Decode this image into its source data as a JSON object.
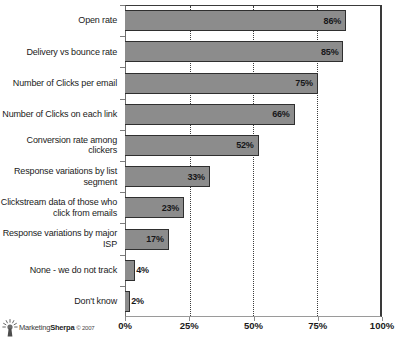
{
  "chart_data": {
    "type": "bar",
    "orientation": "horizontal",
    "title": "",
    "xlabel": "",
    "ylabel": "",
    "xlim": [
      0,
      100
    ],
    "xticks": [
      "0%",
      "25%",
      "50%",
      "75%",
      "100%"
    ],
    "xtick_values": [
      0,
      25,
      50,
      75,
      100
    ],
    "grid": "vertical-dotted",
    "legend": "none",
    "categories": [
      "Open rate",
      "Delivery vs bounce rate",
      "Number of Clicks per email",
      "Number of Clicks on each link",
      "Conversion rate among clickers",
      "Response variations by list segment",
      "Clickstream data of those who click from emails",
      "Response variations by major ISP",
      "None - we do not track",
      "Don't know"
    ],
    "values": [
      86,
      85,
      75,
      66,
      52,
      33,
      23,
      17,
      4,
      2
    ],
    "data_labels": [
      "86%",
      "85%",
      "75%",
      "66%",
      "52%",
      "33%",
      "23%",
      "17%",
      "4%",
      "2%"
    ],
    "bar_color": "#8c8c8c",
    "bar_border_color": "#2f2f2f"
  },
  "footer": {
    "logo_icon": "sunburst-icon",
    "brand_prefix": "Marketing",
    "brand_suffix": "Sherpa",
    "copyright": "© 2007"
  }
}
